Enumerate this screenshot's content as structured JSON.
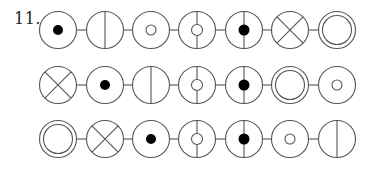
{
  "puzzle": {
    "number_label": "11.",
    "stroke_color": "#555555",
    "fill_color": "#000000",
    "symbol_legend": {
      "dot": "circle with solid black dot in center",
      "vline": "circle split by vertical line",
      "ring": "circle with small hollow circle in center",
      "t_ring": "circle with small hollow circle and vertical line segments above and below",
      "t_dot": "circle with solid black dot and vertical line segments above and below",
      "cross": "circle with X (diagonal cross)",
      "double": "double concentric circle"
    },
    "rows": [
      {
        "symbols": [
          "dot",
          "vline",
          "ring",
          "t_ring",
          "t_dot",
          "cross",
          "double"
        ]
      },
      {
        "symbols": [
          "cross",
          "dot",
          "vline",
          "t_ring",
          "t_dot",
          "double",
          "ring"
        ]
      },
      {
        "symbols": [
          "double",
          "cross",
          "dot",
          "t_ring",
          "t_dot",
          "ring",
          "vline"
        ]
      }
    ]
  },
  "layout": {
    "row_y": [
      30,
      85,
      139
    ],
    "col_x": [
      58,
      105,
      151,
      197,
      244,
      290,
      337
    ],
    "radius": 18.5
  }
}
